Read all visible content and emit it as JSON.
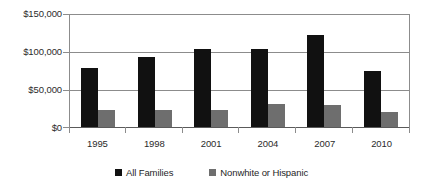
{
  "chart_data": {
    "type": "bar",
    "title": "",
    "subtitle": "",
    "xlabel": "",
    "ylabel": "",
    "categories": [
      "1995",
      "1998",
      "2001",
      "2004",
      "2007",
      "2010"
    ],
    "series": [
      {
        "name": "All Families",
        "color": "#111111",
        "values": [
          79000,
          93000,
          103000,
          104000,
          122000,
          75000
        ]
      },
      {
        "name": "Nonwhite or Hispanic",
        "color": "#6e6e6e",
        "values": [
          22000,
          23000,
          23000,
          30000,
          29000,
          20000
        ]
      }
    ],
    "ylim": [
      0,
      150000
    ],
    "yticks": [
      0,
      50000,
      100000,
      150000
    ],
    "ytick_labels": [
      "$0",
      "$50,000",
      "$100,000",
      "$150,000"
    ],
    "grid": true,
    "legend_position": "bottom",
    "annotations": []
  },
  "axis": {
    "y_labels": {
      "l150": "$150,000",
      "l100": "$100,000",
      "l50": "$50,000",
      "l0": "$0"
    },
    "x_labels": [
      "1995",
      "1998",
      "2001",
      "2004",
      "2007",
      "2010"
    ]
  },
  "legend": {
    "items": [
      {
        "label": "All Families",
        "swatch": "black-square-marker"
      },
      {
        "label": "Nonwhite or Hispanic",
        "swatch": "gray-square-marker"
      }
    ]
  },
  "colors": {
    "series_a": "#111111",
    "series_b": "#6e6e6e",
    "gridline": "#8c8c8c",
    "axis_text": "#2b2b2b",
    "background": "#ffffff"
  }
}
